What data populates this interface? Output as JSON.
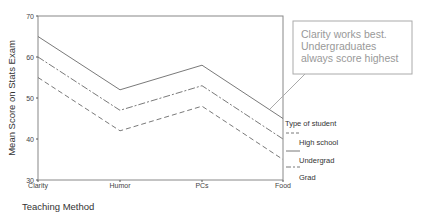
{
  "chart_data": {
    "type": "line",
    "title": "",
    "xlabel": "Teaching Method",
    "ylabel": "Mean Score on Stats Exam",
    "categories": [
      "Clarity",
      "Humor",
      "PCs",
      "Food"
    ],
    "ylim": [
      30,
      70
    ],
    "yticks": [
      30,
      40,
      50,
      60,
      70
    ],
    "grid": false,
    "legend": {
      "title": "Type of student",
      "position": "right",
      "entries": [
        "High school",
        "Undergrad",
        "Grad"
      ]
    },
    "series": [
      {
        "name": "High school",
        "style": "dashed",
        "values": [
          55,
          42,
          48,
          35
        ]
      },
      {
        "name": "Undergrad",
        "style": "solid",
        "values": [
          65,
          52,
          58,
          45
        ]
      },
      {
        "name": "Grad",
        "style": "dashdot",
        "values": [
          60,
          47,
          53,
          40
        ]
      }
    ],
    "annotations": [
      {
        "text_lines": [
          "Clarity works best.",
          "Undergraduates",
          "always score highest"
        ],
        "points_to": "Undergrad at Food"
      }
    ]
  },
  "colors": {
    "line": "#6a6a6a",
    "axis": "#888888",
    "callout_border": "#aaaaaa",
    "callout_text": "#999999"
  }
}
